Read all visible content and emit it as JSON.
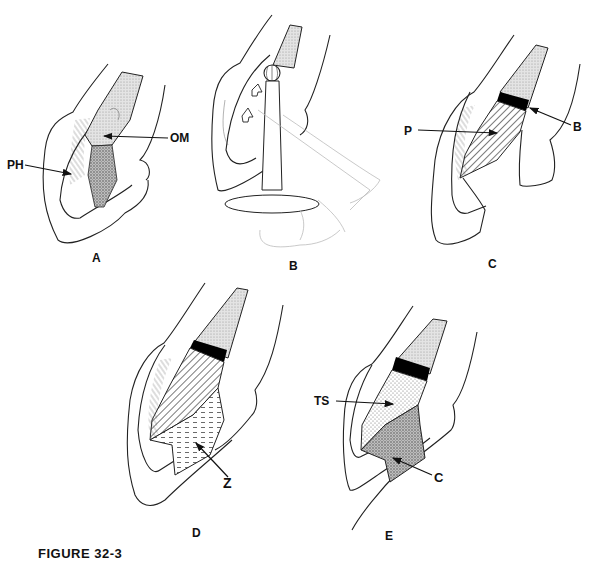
{
  "figure": {
    "caption": "FIGURE 32-3",
    "panels": [
      {
        "id": "A",
        "label": "A",
        "annotations": [
          {
            "text": "PH",
            "meaning": "periodontal hairs/fibers"
          },
          {
            "text": "OM"
          }
        ]
      },
      {
        "id": "B",
        "label": "B",
        "annotations": []
      },
      {
        "id": "C",
        "label": "C",
        "annotations": [
          {
            "text": "P"
          },
          {
            "text": "B"
          }
        ]
      },
      {
        "id": "D",
        "label": "D",
        "annotations": [
          {
            "text": "Z"
          }
        ]
      },
      {
        "id": "E",
        "label": "E",
        "annotations": [
          {
            "text": "TS"
          },
          {
            "text": "C"
          }
        ]
      }
    ]
  },
  "labels": {
    "A": {
      "panel": "A",
      "ph": "PH",
      "om": "OM"
    },
    "B": {
      "panel": "B"
    },
    "C": {
      "panel": "C",
      "p": "P",
      "b": "B"
    },
    "D": {
      "panel": "D",
      "z": "Z"
    },
    "E": {
      "panel": "E",
      "ts": "TS",
      "c": "C"
    }
  },
  "colors": {
    "outline": "#222222",
    "stipple_light": "#cfcfcf",
    "stipple_dark": "#9a9a9a",
    "band": "#000000"
  }
}
